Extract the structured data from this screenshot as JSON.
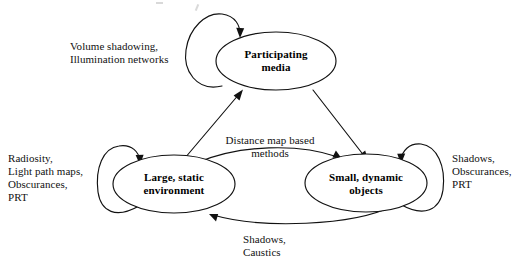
{
  "diagram": {
    "type": "directed-graph",
    "title": "",
    "nodes": [
      {
        "id": "participating-media",
        "label_line1": "Participating",
        "label_line2": "media"
      },
      {
        "id": "large-static-environment",
        "label_line1": "Large, static",
        "label_line2": "environment"
      },
      {
        "id": "small-dynamic-objects",
        "label_line1": "Small, dynamic",
        "label_line2": "objects"
      }
    ],
    "edge_labels": {
      "participating_self": {
        "line1": "Volume shadowing,",
        "line2": "Illumination networks"
      },
      "large_static_self": {
        "line1": "Radiosity,",
        "line2": "Light path maps,",
        "line3": "Obscurances,",
        "line4": "PRT"
      },
      "small_dynamic_self": {
        "line1": "Shadows,",
        "line2": "Obscurances,",
        "line3": "PRT"
      },
      "large_to_small": {
        "line1": "Distance map based",
        "line2": "methods"
      },
      "small_to_large": {
        "line1": "Shadows,",
        "line2": "Caustics"
      }
    },
    "edges": [
      {
        "id": "self-participating",
        "from": "participating-media",
        "to": "participating-media",
        "label": "Volume shadowing, Illumination networks"
      },
      {
        "id": "self-large-static",
        "from": "large-static-environment",
        "to": "large-static-environment",
        "label": "Radiosity, Light path maps, Obscurances, PRT"
      },
      {
        "id": "self-small-dynamic",
        "from": "small-dynamic-objects",
        "to": "small-dynamic-objects",
        "label": "Shadows, Obscurances, PRT"
      },
      {
        "id": "large-to-participating",
        "from": "large-static-environment",
        "to": "participating-media",
        "label": ""
      },
      {
        "id": "participating-to-small",
        "from": "participating-media",
        "to": "small-dynamic-objects",
        "label": ""
      },
      {
        "id": "large-to-small",
        "from": "large-static-environment",
        "to": "small-dynamic-objects",
        "label": "Distance map based methods"
      },
      {
        "id": "small-to-large",
        "from": "small-dynamic-objects",
        "to": "large-static-environment",
        "label": "Shadows, Caustics"
      }
    ],
    "colors": {
      "stroke": "#111111",
      "fill": "#ffffff",
      "text": "#000000"
    }
  }
}
